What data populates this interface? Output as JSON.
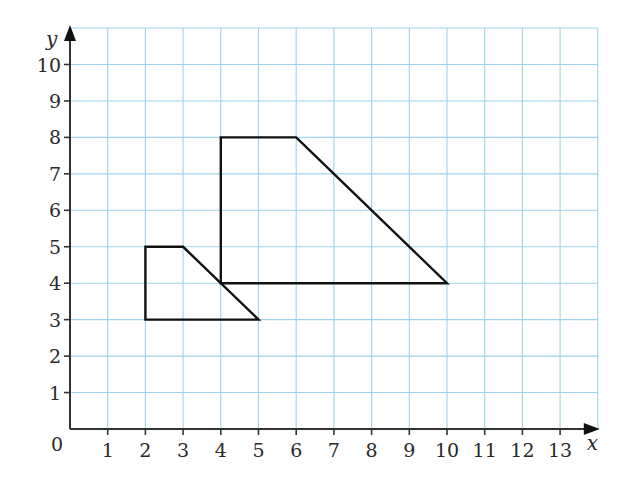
{
  "chart_data": {
    "type": "diagram",
    "title": "",
    "xlabel": "x",
    "ylabel": "y",
    "xlim": [
      0,
      14
    ],
    "ylim": [
      0,
      11
    ],
    "grid": true,
    "origin_label": "0",
    "x_ticks": [
      1,
      2,
      3,
      4,
      5,
      6,
      7,
      8,
      9,
      10,
      11,
      12,
      13
    ],
    "y_ticks": [
      1,
      2,
      3,
      4,
      5,
      6,
      7,
      8,
      9,
      10
    ],
    "shapes": [
      {
        "name": "small-trapezium",
        "vertices": [
          [
            2,
            3
          ],
          [
            2,
            5
          ],
          [
            3,
            5
          ],
          [
            5,
            3
          ]
        ]
      },
      {
        "name": "large-trapezium",
        "vertices": [
          [
            4,
            4
          ],
          [
            4,
            8
          ],
          [
            6,
            8
          ],
          [
            10,
            4
          ]
        ]
      }
    ]
  },
  "colors": {
    "grid": "#9ed3ea",
    "axis": "#333333",
    "shape": "#111111",
    "background": "#ffffff"
  },
  "layout": {
    "origin_px": [
      70,
      429
    ],
    "unit_x_px": 37.7,
    "unit_y_px": 36.45
  }
}
